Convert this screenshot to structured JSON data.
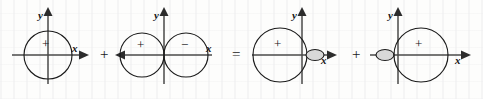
{
  "figure": {
    "background_color": "#fdfdfc",
    "ink_color": "#1b1b1b",
    "axis_color": "#4a4a4a",
    "lobe_fill_color": "#d8d8d8"
  },
  "axis_labels": {
    "x": "x",
    "y": "y"
  },
  "operators": [
    {
      "symbol": "+",
      "name": "plus-operator-1"
    },
    {
      "symbol": "=",
      "name": "equals-operator"
    },
    {
      "symbol": "+",
      "name": "plus-operator-2"
    }
  ],
  "panels": [
    {
      "id": "panel-omnidirectional",
      "caption": "circle centered at origin",
      "x_arrow_direction": "right",
      "lobes": [
        {
          "sign": "+",
          "shape": "circle",
          "position": "origin"
        }
      ]
    },
    {
      "id": "panel-dipole",
      "caption": "two tangent circles, left positive right negative",
      "x_arrow_direction": "left",
      "lobes": [
        {
          "sign": "+",
          "shape": "circle",
          "position": "left"
        },
        {
          "sign": "−",
          "shape": "circle",
          "position": "right"
        }
      ]
    },
    {
      "id": "panel-cardioid-right",
      "caption": "large left circle with small shaded right lobe",
      "x_arrow_direction": "right",
      "lobes": [
        {
          "sign": "+",
          "shape": "circle",
          "position": "left"
        },
        {
          "sign": "",
          "shape": "ellipse",
          "position": "right-small"
        }
      ]
    },
    {
      "id": "panel-cardioid-left",
      "caption": "large right circle with small shaded left lobe",
      "x_arrow_direction": "right",
      "lobes": [
        {
          "sign": "",
          "shape": "ellipse",
          "position": "left-small"
        },
        {
          "sign": "+",
          "shape": "circle",
          "position": "right"
        }
      ]
    }
  ]
}
